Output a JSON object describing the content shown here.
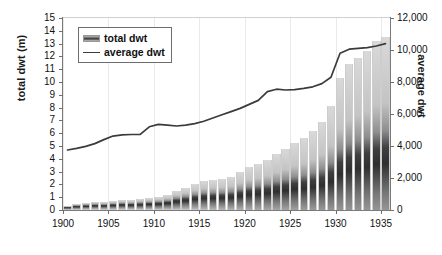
{
  "chart_data": {
    "type": "bar",
    "title": "",
    "subtitle": "",
    "xlabel": "",
    "ylabel": "total dwt (m)",
    "y2label": "average dwt",
    "grid": "vertical-light",
    "legend_position": "top-left-inside",
    "xlim": [
      1900,
      1935
    ],
    "ylim": [
      0,
      15
    ],
    "y2lim": [
      0,
      12000
    ],
    "yticks": [
      0,
      1,
      2,
      3,
      4,
      5,
      6,
      7,
      8,
      9,
      10,
      11,
      12,
      13,
      14,
      15
    ],
    "ytick_labels": [
      "0",
      "1",
      "2",
      "3",
      "4",
      "5",
      "6",
      "7",
      "8",
      "9",
      "10",
      "11",
      "12",
      "13",
      "14",
      "15"
    ],
    "y2ticks": [
      0,
      2000,
      4000,
      6000,
      8000,
      10000,
      12000
    ],
    "y2tick_labels": [
      "0",
      "2,000",
      "4,000",
      "6,000",
      "8,000",
      "10,000",
      "12,000"
    ],
    "xticks": [
      1900,
      1905,
      1910,
      1915,
      1920,
      1925,
      1930,
      1935
    ],
    "xtick_labels": [
      "1900",
      "1905",
      "1910",
      "1915",
      "1920",
      "1925",
      "1930",
      "1935"
    ],
    "x": [
      1900,
      1901,
      1902,
      1903,
      1904,
      1905,
      1906,
      1907,
      1908,
      1909,
      1910,
      1911,
      1912,
      1913,
      1914,
      1915,
      1916,
      1917,
      1918,
      1919,
      1920,
      1921,
      1922,
      1923,
      1924,
      1925,
      1926,
      1927,
      1928,
      1929,
      1930,
      1931,
      1932,
      1933,
      1934,
      1935
    ],
    "series": [
      {
        "name": "total dwt",
        "axis": "left",
        "unit": "m",
        "type": "bar",
        "values": [
          0.35,
          0.5,
          0.55,
          0.6,
          0.62,
          0.7,
          0.78,
          0.82,
          0.88,
          0.95,
          1.05,
          1.2,
          1.45,
          1.75,
          2.0,
          2.25,
          2.35,
          2.4,
          2.55,
          2.95,
          3.35,
          3.6,
          3.9,
          4.35,
          4.8,
          5.2,
          5.6,
          6.2,
          6.9,
          8.1,
          10.3,
          11.4,
          11.9,
          12.45,
          13.2,
          13.55
        ]
      },
      {
        "name": "average dwt",
        "axis": "right",
        "type": "line",
        "values": [
          3750,
          3850,
          3980,
          4150,
          4400,
          4620,
          4700,
          4720,
          4730,
          5200,
          5350,
          5300,
          5250,
          5300,
          5400,
          5550,
          5750,
          5950,
          6150,
          6350,
          6600,
          6850,
          7400,
          7550,
          7500,
          7520,
          7600,
          7700,
          7900,
          8300,
          9800,
          10050,
          10100,
          10150,
          10250,
          10400
        ]
      }
    ],
    "annotations": []
  },
  "legend": {
    "items": [
      {
        "label": "total dwt",
        "marker": "bar-swatch-icon"
      },
      {
        "label": "average dwt",
        "marker": "line-swatch-icon"
      }
    ]
  },
  "style": {
    "line_color": "#3b3b3b",
    "bar_light": "#cfcfcf",
    "bar_dark": "#3a3a3a",
    "axis_color": "#7a7a7a",
    "text_color": "#111111",
    "gridline_color": "#e9e9e9",
    "background": "#ffffff"
  }
}
